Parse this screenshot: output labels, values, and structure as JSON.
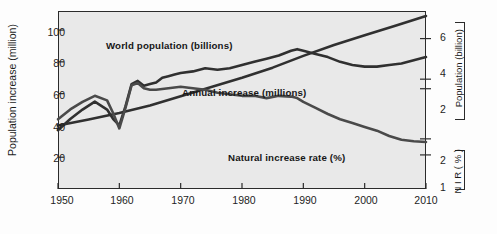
{
  "chart_data": {
    "type": "line",
    "title": "",
    "xlabel": "",
    "xlim": [
      1950,
      2010
    ],
    "xticks": [
      1950,
      1960,
      1970,
      1980,
      1990,
      2000,
      2010
    ],
    "xticklabels": [
      "1950",
      "1960",
      "1970",
      "1980",
      "1990",
      "2000",
      "2010"
    ],
    "grid": false,
    "legend": "inline-annotations",
    "axes": {
      "left": {
        "label": "Population increase (million)",
        "ticks": [
          20,
          40,
          60,
          80,
          100
        ],
        "ticklabels": [
          "20",
          "40",
          "60",
          "80",
          "100"
        ],
        "lim": [
          0,
          112
        ]
      },
      "right_upper": {
        "label": "Population",
        "label_units": "(billion)",
        "ticks": [
          2,
          4,
          6
        ],
        "ticklabels": [
          "2",
          "4",
          "6"
        ],
        "lim": [
          0,
          7.1
        ]
      },
      "right_lower": {
        "label": "N I R",
        "label_units": "( % )",
        "ticks": [
          1,
          2
        ],
        "ticklabels": [
          "1",
          "2"
        ],
        "lim": [
          0.55,
          2.9
        ]
      }
    },
    "series": [
      {
        "name": "World population (billions)",
        "axis": "right_upper",
        "color": "#303030",
        "annotation": "World population (billions)",
        "x": [
          1950,
          1955,
          1960,
          1965,
          1970,
          1975,
          1980,
          1985,
          1990,
          1995,
          2000,
          2005,
          2010
        ],
        "values": [
          2.53,
          2.77,
          3.03,
          3.33,
          3.7,
          4.07,
          4.44,
          4.84,
          5.31,
          5.74,
          6.13,
          6.51,
          6.9
        ]
      },
      {
        "name": "Annual increase (millions)",
        "axis": "left",
        "color": "#303030",
        "annotation": "Annual increase (millions)",
        "x": [
          1950,
          1952,
          1954,
          1956,
          1958,
          1959,
          1960,
          1961,
          1962,
          1963,
          1964,
          1965,
          1966,
          1967,
          1968,
          1969,
          1970,
          1972,
          1974,
          1976,
          1978,
          1980,
          1982,
          1984,
          1986,
          1988,
          1989,
          1990,
          1992,
          1994,
          1996,
          1998,
          2000,
          2002,
          2004,
          2006,
          2008,
          2010
        ],
        "values": [
          37,
          44,
          50,
          55,
          50,
          44,
          40,
          52,
          66,
          68,
          65,
          66,
          67,
          70,
          71,
          72,
          73,
          74,
          76,
          75,
          76,
          78,
          80,
          82,
          84,
          87,
          88,
          87,
          85,
          83,
          80,
          78,
          77,
          77,
          78,
          79,
          81,
          83
        ]
      },
      {
        "name": "Natural increase rate (%)",
        "axis": "right_lower",
        "color": "#4a4a4a",
        "annotation": "Natural increase rate (%)",
        "x": [
          1950,
          1952,
          1954,
          1956,
          1958,
          1959,
          1960,
          1961,
          1962,
          1963,
          1964,
          1965,
          1966,
          1968,
          1970,
          1972,
          1974,
          1976,
          1978,
          1980,
          1982,
          1984,
          1986,
          1988,
          1989,
          1990,
          1992,
          1994,
          1996,
          1998,
          2000,
          2002,
          2004,
          2006,
          2008,
          2010
        ],
        "values": [
          1.47,
          1.6,
          1.7,
          1.78,
          1.72,
          1.55,
          1.35,
          1.62,
          1.92,
          1.95,
          1.88,
          1.86,
          1.86,
          1.88,
          1.9,
          1.88,
          1.86,
          1.82,
          1.8,
          1.78,
          1.78,
          1.75,
          1.78,
          1.77,
          1.75,
          1.7,
          1.62,
          1.54,
          1.47,
          1.42,
          1.37,
          1.32,
          1.25,
          1.2,
          1.18,
          1.17
        ]
      }
    ]
  },
  "labels": {
    "y_left_title": "Population increase (million)",
    "population_bracket": "Population",
    "population_bracket_units": "(billion)",
    "nir_bracket": "N I R",
    "nir_bracket_units": "( % )",
    "series_world_population": "World population (billions)",
    "series_annual_increase": "Annual increase (millions)",
    "series_nir": "Natural increase rate (%)"
  },
  "ticks": {
    "left": [
      "100",
      "80",
      "60",
      "40",
      "20"
    ],
    "right_population": [
      "6",
      "4",
      "2"
    ],
    "right_nir": [
      "2",
      "1"
    ],
    "x": [
      "1950",
      "1960",
      "1970",
      "1980",
      "1990",
      "2000",
      "2010"
    ]
  },
  "colors": {
    "plot_background": "#e9e9e9",
    "frame": "#2b2b2b",
    "series_line": "#303030",
    "text": "#1e1e1e"
  }
}
